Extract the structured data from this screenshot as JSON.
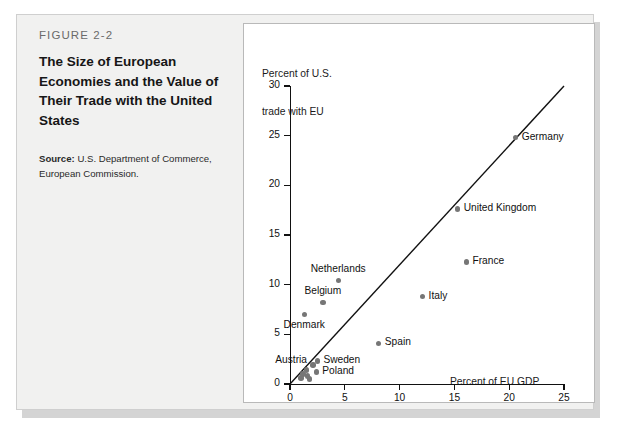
{
  "figure": {
    "number": "FIGURE 2-2",
    "title": "The Size of European Economies and the Value of Their Trade with the United States",
    "source_label": "Source:",
    "source_text": " U.S. Department of Commerce, European Commission."
  },
  "chart_data": {
    "type": "scatter",
    "title": "",
    "xlabel": "Percent of EU GDP",
    "ylabel": "Percent of U.S.\ntrade with EU",
    "ylabel_line1": "Percent of U.S.",
    "ylabel_line2": "trade with EU",
    "xlim": [
      0,
      25
    ],
    "ylim": [
      0,
      30
    ],
    "xticks": [
      0,
      5,
      10,
      15,
      20,
      25
    ],
    "yticks": [
      0,
      5,
      10,
      15,
      20,
      25,
      30
    ],
    "xtick_labels": [
      "0",
      "5",
      "10",
      "15",
      "20",
      "25"
    ],
    "ytick_labels": [
      "0",
      "5",
      "10",
      "15",
      "20",
      "25",
      "30"
    ],
    "grid": false,
    "legend": "none",
    "reference_line": {
      "name": "45-degree line",
      "from": [
        0,
        0
      ],
      "to": [
        25,
        30
      ],
      "color": "#111111"
    },
    "points": [
      {
        "label": "Germany",
        "x": 20.6,
        "y": 24.8,
        "label_pos": "right"
      },
      {
        "label": "United Kingdom",
        "x": 15.3,
        "y": 17.6,
        "label_pos": "right"
      },
      {
        "label": "France",
        "x": 16.1,
        "y": 12.3,
        "label_pos": "right"
      },
      {
        "label": "Italy",
        "x": 12.1,
        "y": 8.8,
        "label_pos": "right"
      },
      {
        "label": "Netherlands",
        "x": 4.4,
        "y": 10.4,
        "label_pos": "above"
      },
      {
        "label": "Belgium",
        "x": 3.0,
        "y": 8.2,
        "label_pos": "above"
      },
      {
        "label": "Denmark",
        "x": 1.3,
        "y": 7.0,
        "label_pos": "below"
      },
      {
        "label": "Spain",
        "x": 8.1,
        "y": 4.1,
        "label_pos": "right"
      },
      {
        "label": "Sweden",
        "x": 2.5,
        "y": 2.3,
        "label_pos": "right"
      },
      {
        "label": "Austria",
        "x": 2.1,
        "y": 1.9,
        "label_pos": "left"
      },
      {
        "label": "Poland",
        "x": 2.4,
        "y": 1.2,
        "label_pos": "right"
      },
      {
        "label": "",
        "x": 1.5,
        "y": 1.4,
        "label_pos": "none"
      },
      {
        "label": "",
        "x": 1.2,
        "y": 1.0,
        "label_pos": "none"
      },
      {
        "label": "",
        "x": 1.6,
        "y": 0.8,
        "label_pos": "none"
      },
      {
        "label": "",
        "x": 1.0,
        "y": 0.6,
        "label_pos": "none"
      },
      {
        "label": "",
        "x": 1.8,
        "y": 0.5,
        "label_pos": "none"
      }
    ],
    "point_color": "#767676"
  },
  "colors": {
    "panel_background": "#f1f1f0",
    "chart_background": "#ffffff",
    "axis": "#111111",
    "marker": "#767676"
  }
}
